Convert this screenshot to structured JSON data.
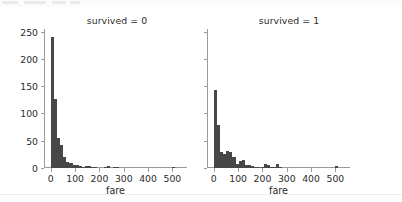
{
  "figure": {
    "background_color": "#ffffff",
    "bar_color": "#474747",
    "axis_color": "#9a9a9a",
    "text_color": "#2b2b2b"
  },
  "chart_data": {
    "type": "bar",
    "title": "",
    "subtitle": "",
    "facet_variable": "survived",
    "panels": [
      {
        "title": "survived = 0",
        "xlabel": "fare",
        "ylabel": "",
        "xlim": [
          -28,
          560
        ],
        "ylim": [
          0,
          255
        ],
        "xticks": [
          0,
          100,
          200,
          300,
          400,
          500
        ],
        "xticklabels": [
          "0",
          "100",
          "200",
          "300",
          "400",
          "500"
        ],
        "yticks": [
          0,
          50,
          100,
          150,
          200,
          250
        ],
        "yticklabels": [
          "0",
          "50",
          "100",
          "150",
          "200",
          "250"
        ],
        "grid": false,
        "bin_width": 12.8,
        "bin_edges": [
          0,
          12.8,
          25.6,
          38.4,
          51.2,
          64,
          76.8,
          89.6,
          102.4,
          115.2,
          128,
          140.8,
          153.6,
          166.4,
          179.2,
          192,
          204.8,
          217.6,
          230.4,
          243.2,
          256,
          268.8,
          281.6,
          294.4,
          307.2,
          320,
          332.8,
          345.6,
          358.4,
          371.2,
          384,
          396.8,
          409.6,
          422.4,
          435.2,
          448,
          460.8,
          473.6,
          486.4,
          499.2,
          512
        ],
        "values": [
          240,
          127,
          55,
          43,
          21,
          11,
          10,
          6,
          5,
          3,
          2,
          4,
          3,
          2,
          1,
          0,
          0,
          1,
          3,
          0,
          1,
          1,
          0,
          0,
          0,
          0,
          0,
          0,
          0,
          0,
          0,
          0,
          0,
          0,
          0,
          0,
          0,
          0,
          0,
          1
        ]
      },
      {
        "title": "survived = 1",
        "xlabel": "fare",
        "ylabel": "",
        "xlim": [
          -28,
          560
        ],
        "ylim": [
          0,
          255
        ],
        "xticks": [
          0,
          100,
          200,
          300,
          400,
          500
        ],
        "xticklabels": [
          "0",
          "100",
          "200",
          "300",
          "400",
          "500"
        ],
        "yticks": [
          0,
          50,
          100,
          150,
          200,
          250
        ],
        "yticklabels": [
          "0",
          "50",
          "100",
          "150",
          "200",
          "250"
        ],
        "grid": false,
        "bin_width": 12.8,
        "bin_edges": [
          0,
          12.8,
          25.6,
          38.4,
          51.2,
          64,
          76.8,
          89.6,
          102.4,
          115.2,
          128,
          140.8,
          153.6,
          166.4,
          179.2,
          192,
          204.8,
          217.6,
          230.4,
          243.2,
          256,
          268.8,
          281.6,
          294.4,
          307.2,
          320,
          332.8,
          345.6,
          358.4,
          371.2,
          384,
          396.8,
          409.6,
          422.4,
          435.2,
          448,
          460.8,
          473.6,
          486.4,
          499.2,
          512
        ],
        "values": [
          143,
          78,
          29,
          25,
          31,
          29,
          20,
          8,
          13,
          14,
          6,
          5,
          4,
          2,
          1,
          1,
          7,
          6,
          2,
          1,
          7,
          1,
          0,
          0,
          0,
          0,
          0,
          0,
          0,
          0,
          0,
          0,
          0,
          0,
          0,
          0,
          0,
          0,
          0,
          3
        ]
      }
    ]
  }
}
